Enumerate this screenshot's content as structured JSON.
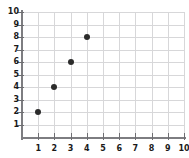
{
  "chart_data": {
    "type": "scatter",
    "title": "",
    "xlabel": "",
    "ylabel": "",
    "xlim": [
      0,
      10
    ],
    "ylim": [
      0,
      10
    ],
    "grid": true,
    "legend": false,
    "x_ticks": [
      "1",
      "2",
      "3",
      "4",
      "5",
      "6",
      "7",
      "8",
      "9",
      "10"
    ],
    "y_ticks": [
      "1",
      "2",
      "3",
      "4",
      "5",
      "6",
      "7",
      "8",
      "9",
      "10"
    ],
    "marker_color": "#2b2b2b",
    "grid_color": "#d7d7d9",
    "axis_color": "#7d7d81",
    "series": [
      {
        "name": "",
        "points": [
          {
            "x": 1,
            "y": 2
          },
          {
            "x": 2,
            "y": 4
          },
          {
            "x": 3,
            "y": 6
          },
          {
            "x": 4,
            "y": 8
          }
        ]
      }
    ]
  }
}
